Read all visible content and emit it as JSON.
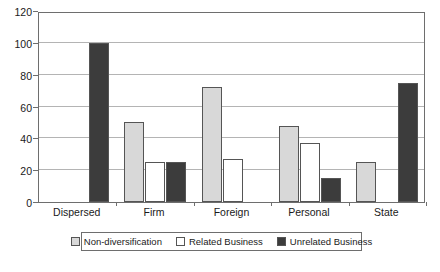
{
  "chart_data": {
    "type": "bar",
    "title": "",
    "subtitle": "",
    "xlabel": "",
    "ylabel": "",
    "ylim": [
      0,
      120
    ],
    "ytick_values": [
      0,
      20,
      40,
      60,
      80,
      100,
      120
    ],
    "ytick_labels": [
      "0",
      "20",
      "40",
      "60",
      "80",
      "100",
      "120"
    ],
    "grid": true,
    "legend_position": "bottom",
    "categories": [
      "Dispersed",
      "Firm",
      "Foreign",
      "Personal",
      "State"
    ],
    "series": [
      {
        "name": "Non-diversification",
        "color": "#d8d8d8",
        "values": [
          0,
          50,
          72,
          48,
          25
        ]
      },
      {
        "name": "Related Business",
        "color": "#ffffff",
        "values": [
          0,
          25,
          27,
          37,
          0
        ]
      },
      {
        "name": "Unrelated Business",
        "color": "#3c3c3c",
        "values": [
          100,
          25,
          0,
          15,
          75
        ]
      }
    ]
  },
  "colors": {
    "non_diversification": "#d8d8d8",
    "related_business": "#ffffff",
    "unrelated_business": "#3c3c3c",
    "bar_border": "#555555",
    "gridline": "#b4b4b4",
    "axis": "#6e6e6e",
    "text": "#1a1a1a",
    "background": "#ffffff"
  }
}
